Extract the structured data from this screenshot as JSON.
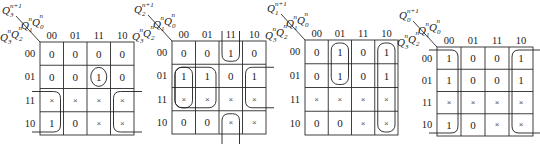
{
  "figure": {
    "col_headers": [
      "00",
      "01",
      "11",
      "10"
    ],
    "row_headers": [
      "00",
      "01",
      "11",
      "10"
    ],
    "col_var_label": {
      "a": "Q",
      "a_sub": "1",
      "a_sup": "n",
      "b": "Q",
      "b_sub": "0",
      "b_sup": "n"
    },
    "row_var_label": {
      "a": "Q",
      "a_sub": "3",
      "a_sup": "n",
      "b": "Q",
      "b_sub": "2",
      "b_sup": "n"
    },
    "dont_care_symbol": "×"
  },
  "maps": [
    {
      "name": "kmap-q3",
      "output_label": {
        "base": "Q",
        "sub": "3",
        "sup": "n+1"
      },
      "grid": {
        "x": 40,
        "y": 42,
        "w": 94,
        "h": 93
      },
      "cells": [
        [
          "0",
          "0",
          "0",
          "0"
        ],
        [
          "0",
          "0",
          "1",
          "0"
        ],
        [
          "×",
          "×",
          "×",
          "×"
        ],
        [
          "1",
          "0",
          "×",
          "×"
        ]
      ],
      "loops": [
        {
          "type": "circle",
          "row": 1,
          "col": 3
        },
        {
          "type": "wrap-left",
          "rows": [
            2,
            3
          ],
          "col": 0
        },
        {
          "type": "wrap-right",
          "rows": [
            2,
            3
          ],
          "col": 3
        }
      ]
    },
    {
      "name": "kmap-q2",
      "output_label": {
        "base": "Q",
        "sub": "2",
        "sup": "n+1"
      },
      "grid": {
        "x": 172,
        "y": 41,
        "w": 94,
        "h": 93
      },
      "cells": [
        [
          "0",
          "0",
          "1",
          "0"
        ],
        [
          "1",
          "1",
          "0",
          "1"
        ],
        [
          "×",
          "×",
          "×",
          "×"
        ],
        [
          "0",
          "0",
          "×",
          "×"
        ]
      ],
      "loops": [
        {
          "type": "wrap-top",
          "col": 2,
          "row": 0
        },
        {
          "type": "wrap-bottom",
          "col": 2,
          "row": 3
        },
        {
          "type": "rect",
          "r0": 1,
          "r1": 2,
          "c0": 0,
          "c1": 0
        },
        {
          "type": "rect",
          "r0": 1,
          "r1": 2,
          "c0": 0,
          "c1": 1
        },
        {
          "type": "wrap-left",
          "rows": [
            1,
            2
          ],
          "col": 0,
          "hidden": true
        },
        {
          "type": "wrap-right",
          "rows": [
            1,
            2
          ],
          "col": 3
        }
      ]
    },
    {
      "name": "kmap-q1",
      "output_label": {
        "base": "Q",
        "sub": "1",
        "sup": "n+1"
      },
      "grid": {
        "x": 305,
        "y": 40,
        "w": 93,
        "h": 95
      },
      "cells": [
        [
          "0",
          "1",
          "0",
          "1"
        ],
        [
          "0",
          "1",
          "0",
          "1"
        ],
        [
          "×",
          "×",
          "×",
          "×"
        ],
        [
          "0",
          "0",
          "×",
          "×"
        ]
      ],
      "loops": [
        {
          "type": "rect",
          "r0": 0,
          "r1": 1,
          "c0": 1,
          "c1": 1
        },
        {
          "type": "rect",
          "r0": 0,
          "r1": 3,
          "c0": 3,
          "c1": 3
        }
      ]
    },
    {
      "name": "kmap-q0",
      "output_label": {
        "base": "Q",
        "sub": "0",
        "sup": "n+1"
      },
      "grid": {
        "x": 437,
        "y": 47,
        "w": 96,
        "h": 89
      },
      "cells": [
        [
          "1",
          "0",
          "0",
          "1"
        ],
        [
          "1",
          "0",
          "0",
          "1"
        ],
        [
          "×",
          "×",
          "×",
          "×"
        ],
        [
          "1",
          "0",
          "×",
          "×"
        ]
      ],
      "loops": [
        {
          "type": "wrap-left",
          "rows": [
            0,
            3
          ],
          "col": 0
        },
        {
          "type": "wrap-right",
          "rows": [
            0,
            3
          ],
          "col": 3
        }
      ]
    }
  ]
}
